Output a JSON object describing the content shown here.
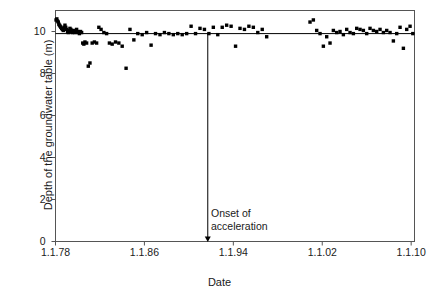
{
  "chart_data": {
    "type": "scatter",
    "title": "",
    "xlabel": "Date",
    "ylabel": "Depth of the groundwater table (m)",
    "xlim": [
      1978.0,
      2010.3
    ],
    "ylim": [
      0,
      11
    ],
    "xtick_labels": [
      "1.1.78",
      "1.1.86",
      "1.1.94",
      "1.1.02",
      "1.1.10"
    ],
    "xtick_values": [
      1978,
      1986,
      1994,
      2002,
      2010
    ],
    "ytick_labels": [
      "0",
      "2",
      "4",
      "6",
      "8",
      "10"
    ],
    "ytick_values": [
      0,
      2,
      4,
      6,
      8,
      10
    ],
    "grid": false,
    "legend": null,
    "marker": "square",
    "marker_color": "#000000",
    "reference_line": {
      "type": "horizontal",
      "y": 9.9,
      "color": "#000000"
    },
    "annotations": [
      {
        "text_lines": [
          "Onset of",
          "acceleration"
        ],
        "x": 1991.7,
        "arrow_from_y": 9.9,
        "arrow_to_y": 0.0,
        "arrow_direction": "down"
      }
    ],
    "series": [
      {
        "name": "Groundwater table depth",
        "x": [
          1978.05,
          1978.12,
          1978.18,
          1978.25,
          1978.3,
          1978.36,
          1978.42,
          1978.48,
          1978.55,
          1978.62,
          1978.7,
          1978.78,
          1978.85,
          1978.92,
          1979.0,
          1979.08,
          1979.15,
          1979.22,
          1979.3,
          1979.38,
          1979.45,
          1979.52,
          1979.6,
          1979.68,
          1979.75,
          1979.82,
          1979.9,
          1979.98,
          1980.05,
          1980.15,
          1980.25,
          1980.35,
          1980.45,
          1980.55,
          1980.65,
          1980.8,
          1980.95,
          1981.1,
          1981.3,
          1981.5,
          1981.7,
          1981.9,
          1982.1,
          1982.35,
          1982.6,
          1982.85,
          1983.1,
          1983.4,
          1983.7,
          1984.0,
          1984.35,
          1984.7,
          1985.05,
          1985.4,
          1985.8,
          1986.2,
          1986.6,
          1987.0,
          1987.4,
          1987.8,
          1988.2,
          1988.6,
          1989.0,
          1989.4,
          1989.8,
          1990.2,
          1990.6,
          1991.0,
          1991.4,
          1991.8,
          1992.2,
          1992.6,
          1993.0,
          1993.4,
          1993.8,
          1994.2,
          1994.6,
          1995.0,
          1995.4,
          1995.8,
          1996.2,
          1996.6,
          1997.0,
          2000.9,
          2001.2,
          2001.5,
          2001.8,
          2002.1,
          2002.4,
          2002.7,
          2003.0,
          2003.3,
          2003.6,
          2003.9,
          2004.2,
          2004.5,
          2004.8,
          2005.1,
          2005.4,
          2005.7,
          2006.0,
          2006.3,
          2006.6,
          2006.9,
          2007.2,
          2007.5,
          2007.8,
          2008.1,
          2008.4,
          2008.7,
          2009.0,
          2009.3,
          2009.6,
          2009.9,
          2010.15
        ],
        "y": [
          10.55,
          10.6,
          10.5,
          10.45,
          10.35,
          10.3,
          10.25,
          10.2,
          10.15,
          10.1,
          10.05,
          10.2,
          10.3,
          10.2,
          10.1,
          10.0,
          9.95,
          10.05,
          10.15,
          10.1,
          10.0,
          9.95,
          10.05,
          10.0,
          9.95,
          10.0,
          10.1,
          10.0,
          9.95,
          9.9,
          10.0,
          9.95,
          9.45,
          9.4,
          9.5,
          9.45,
          8.35,
          8.5,
          9.45,
          9.5,
          9.45,
          10.2,
          10.1,
          9.95,
          9.9,
          9.45,
          9.4,
          9.5,
          9.45,
          9.3,
          8.25,
          10.1,
          9.6,
          9.9,
          9.85,
          9.95,
          9.35,
          9.9,
          9.85,
          9.95,
          9.9,
          9.85,
          9.9,
          9.85,
          9.9,
          10.25,
          9.9,
          10.15,
          10.1,
          9.9,
          10.2,
          9.85,
          10.2,
          10.3,
          10.25,
          9.3,
          10.15,
          10.1,
          10.25,
          10.2,
          9.95,
          10.1,
          9.75,
          10.45,
          10.55,
          10.05,
          9.9,
          9.3,
          9.75,
          9.45,
          10.05,
          9.95,
          10.0,
          9.85,
          10.1,
          9.95,
          9.9,
          10.15,
          10.1,
          10.05,
          9.9,
          10.15,
          10.05,
          10.0,
          10.1,
          9.95,
          10.05,
          9.95,
          9.55,
          9.9,
          10.2,
          9.2,
          10.1,
          10.25,
          9.9
        ]
      }
    ]
  }
}
